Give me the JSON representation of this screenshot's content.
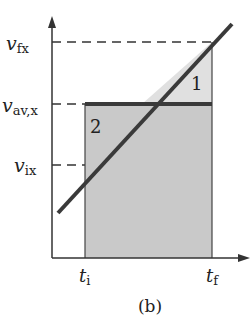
{
  "figure": {
    "caption": "(b)",
    "colors": {
      "axis": "#333333",
      "line": "#3a3a3a",
      "rect_fill": "#c9c9c9",
      "triangle_fill": "#e0e0e0",
      "background": "#ffffff"
    },
    "y_labels": {
      "v_fx": {
        "main": "v",
        "sub": "fx"
      },
      "v_avx": {
        "main": "v",
        "sub": "av,x"
      },
      "v_ix": {
        "main": "v",
        "sub": "ix"
      }
    },
    "x_labels": {
      "t_i": {
        "main": "t",
        "sub": "i"
      },
      "t_f": {
        "main": "t",
        "sub": "f"
      }
    },
    "regions": {
      "region_1": "1",
      "region_2": "2"
    }
  }
}
